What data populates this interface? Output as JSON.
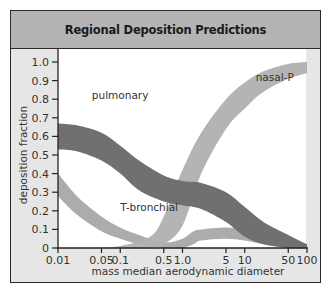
{
  "header": {
    "title": "Regional Deposition Predictions"
  },
  "colors": {
    "frame_bg": "#e6e6e6",
    "header_bg": "#b4b4b4",
    "plot_bg": "#ffffff",
    "pulmonary": "#707070",
    "t_bronchial": "#a8a8a8",
    "nasal_p": "#b0b0b0"
  },
  "chart_data": {
    "type": "area",
    "title": "Regional Deposition Predictions",
    "xlabel": "mass median aerodynamic diameter",
    "ylabel": "deposition fraction",
    "xscale": "log",
    "xlim": [
      0.01,
      100
    ],
    "ylim": [
      0,
      1.0
    ],
    "x_ticks": [
      "0.01",
      "0.05",
      "0.1",
      "0.5",
      "1.0",
      "5",
      "10",
      "50",
      "100"
    ],
    "x_tick_values": [
      0.01,
      0.05,
      0.1,
      0.5,
      1.0,
      5,
      10,
      50,
      100
    ],
    "y_ticks": [
      "0",
      "0.1",
      "0.2",
      "0.3",
      "0.4",
      "0.5",
      "0.6",
      "0.7",
      "0.8",
      "0.9",
      "1.0"
    ],
    "y_tick_values": [
      0,
      0.1,
      0.2,
      0.3,
      0.4,
      0.5,
      0.6,
      0.7,
      0.8,
      0.9,
      1.0
    ],
    "grid": false,
    "legend": "inline labels",
    "series": [
      {
        "name": "pulmonary",
        "label_pos": [
          0.035,
          0.8
        ],
        "x": [
          0.01,
          0.02,
          0.05,
          0.1,
          0.2,
          0.5,
          1.0,
          2,
          5,
          10,
          20,
          50,
          100
        ],
        "upper": [
          0.67,
          0.66,
          0.62,
          0.55,
          0.47,
          0.39,
          0.36,
          0.35,
          0.3,
          0.22,
          0.14,
          0.07,
          0.02
        ],
        "lower": [
          0.53,
          0.52,
          0.47,
          0.4,
          0.31,
          0.25,
          0.23,
          0.21,
          0.14,
          0.06,
          0.02,
          0.0,
          0.0
        ]
      },
      {
        "name": "T-bronchial",
        "label_pos": [
          0.1,
          0.2
        ],
        "x": [
          0.01,
          0.02,
          0.05,
          0.1,
          0.2,
          0.5,
          1.0,
          1.5,
          2,
          5,
          10,
          20,
          50,
          100
        ],
        "upper": [
          0.4,
          0.28,
          0.17,
          0.11,
          0.07,
          0.03,
          0.05,
          0.09,
          0.1,
          0.11,
          0.1,
          0.07,
          0.03,
          0.01
        ],
        "lower": [
          0.28,
          0.18,
          0.09,
          0.05,
          0.02,
          0.0,
          0.0,
          0.02,
          0.04,
          0.05,
          0.04,
          0.02,
          0.0,
          0.0
        ]
      },
      {
        "name": "nasal-P",
        "label_pos": [
          15,
          0.9
        ],
        "x": [
          0.05,
          0.1,
          0.3,
          0.5,
          1.0,
          2,
          5,
          10,
          20,
          50,
          100
        ],
        "upper": [
          0.0,
          0.01,
          0.06,
          0.17,
          0.42,
          0.62,
          0.8,
          0.89,
          0.95,
          0.99,
          1.0
        ],
        "lower": [
          0.0,
          0.0,
          0.0,
          0.02,
          0.12,
          0.4,
          0.64,
          0.75,
          0.84,
          0.91,
          0.94
        ]
      }
    ]
  }
}
